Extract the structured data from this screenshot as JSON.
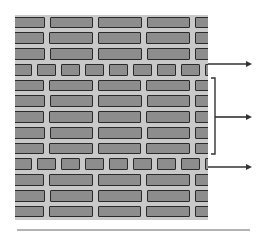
{
  "diagram": {
    "courses": [
      {
        "type": "stretcher",
        "offset": "A"
      },
      {
        "type": "stretcher",
        "offset": "B"
      },
      {
        "type": "stretcher",
        "offset": "A"
      },
      {
        "type": "header"
      },
      {
        "type": "stretcher",
        "offset": "B"
      },
      {
        "type": "stretcher",
        "offset": "A"
      },
      {
        "type": "stretcher",
        "offset": "B"
      },
      {
        "type": "stretcher",
        "offset": "A"
      },
      {
        "type": "stretcher",
        "offset": "B"
      },
      {
        "type": "header"
      },
      {
        "type": "stretcher",
        "offset": "B"
      },
      {
        "type": "stretcher",
        "offset": "A"
      },
      {
        "type": "stretcher",
        "offset": "B"
      }
    ],
    "annotations": [
      {
        "kind": "arrow",
        "target": "header-course-top",
        "label": ""
      },
      {
        "kind": "bracket-arrow",
        "target": "stretcher-courses-group",
        "label": ""
      },
      {
        "kind": "arrow",
        "target": "header-course-bottom",
        "label": ""
      }
    ],
    "colors": {
      "mortar": "#c9c9c9",
      "brick": "#9a9a9a",
      "outline": "#2a2a2a",
      "arrow": "#333333"
    }
  }
}
